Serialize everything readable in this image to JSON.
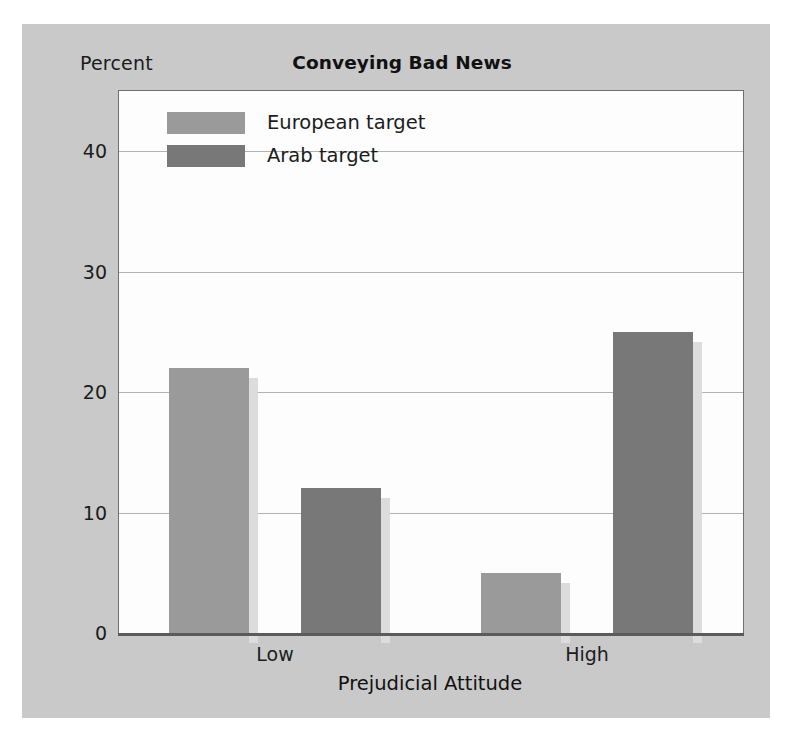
{
  "figure": {
    "percent_caption": "Percent",
    "background_color": "#c9c9c9",
    "plot_background_color": "#fdfdfd"
  },
  "chart_data": {
    "type": "bar",
    "title": "Conveying Bad News",
    "xlabel": "Prejudicial Attitude",
    "ylabel": "Percent",
    "categories": [
      "Low",
      "High"
    ],
    "series": [
      {
        "name": "European target",
        "color": "#9a9a9a",
        "values": [
          22,
          5
        ]
      },
      {
        "name": "Arab target",
        "color": "#787878",
        "values": [
          12,
          25
        ]
      }
    ],
    "ylim": [
      0,
      45
    ],
    "yticks": [
      0,
      10,
      20,
      30,
      40
    ],
    "ytick_labels": [
      "0",
      "10",
      "20",
      "30",
      "40"
    ],
    "grid": true,
    "legend_position": "top-left-inside"
  }
}
